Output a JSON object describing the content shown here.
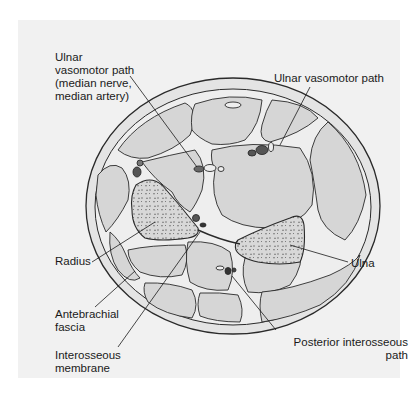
{
  "diagram": {
    "colors": {
      "background": "#f1f1f1",
      "tissue_fill": "#d6d6d6",
      "fascia_fill": "#e9e9e9",
      "outline": "#2a2a2a",
      "bone_speckle": "#555555",
      "vessel_dark": "#4a4a4a"
    },
    "labels": [
      {
        "id": "ulnar-vasomotor-path-median",
        "text": "Ulnar\nvasomotor path\n(median nerve,\nmedian artery)"
      },
      {
        "id": "ulnar-vasomotor-path",
        "text": "Ulnar vasomotor path"
      },
      {
        "id": "radius",
        "text": "Radius"
      },
      {
        "id": "ulna",
        "text": "Ulna"
      },
      {
        "id": "antebrachial-fascia",
        "text": "Antebrachial\nfascia"
      },
      {
        "id": "posterior-interosseous-path",
        "text": "Posterior interosseous\npath"
      },
      {
        "id": "interosseous-membrane",
        "text": "Interosseous\nmembrane"
      }
    ]
  }
}
